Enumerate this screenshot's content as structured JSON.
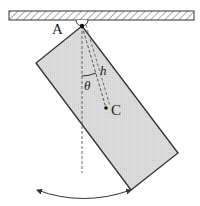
{
  "diagram": {
    "labels": {
      "pivot": "A",
      "center_of_mass": "C",
      "angle": "θ",
      "distance": "h"
    },
    "colors": {
      "block_fill": "#d9d9d9",
      "stroke": "#333333",
      "ceiling_hatch": "#555555"
    }
  }
}
